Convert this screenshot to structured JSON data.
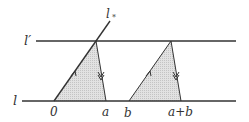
{
  "labels": {
    "l_star": "l",
    "l_star_sub": "*",
    "l_prime": "l′",
    "l": "l",
    "zero": "0",
    "a": "a",
    "b": "b",
    "a_plus_b": "a+b"
  },
  "colors": {
    "stroke": "#333333",
    "fill": "#d8d8d8"
  }
}
